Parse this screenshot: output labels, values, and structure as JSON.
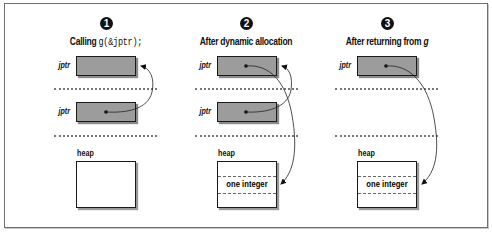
{
  "diagram": {
    "panels": [
      {
        "step": "1",
        "title_prefix": "Calling",
        "title_code": "g(&jptr);",
        "top_var": "jptr",
        "bottom_var": "jptr",
        "heap_label": "heap",
        "heap_cell": ""
      },
      {
        "step": "2",
        "title": "After dynamic allocation",
        "top_var": "jptr",
        "bottom_var": "jptr",
        "heap_label": "heap",
        "heap_cell": "one integer"
      },
      {
        "step": "3",
        "title_prefix": "After returning from",
        "title_italic": "g",
        "top_var": "jptr",
        "heap_label": "heap",
        "heap_cell": "one integer"
      }
    ],
    "colors": {
      "pointer_box": "#9c9c9c",
      "border": "#1a1a1a",
      "frame": "#6e6e6e",
      "background": "#ffffff"
    }
  }
}
